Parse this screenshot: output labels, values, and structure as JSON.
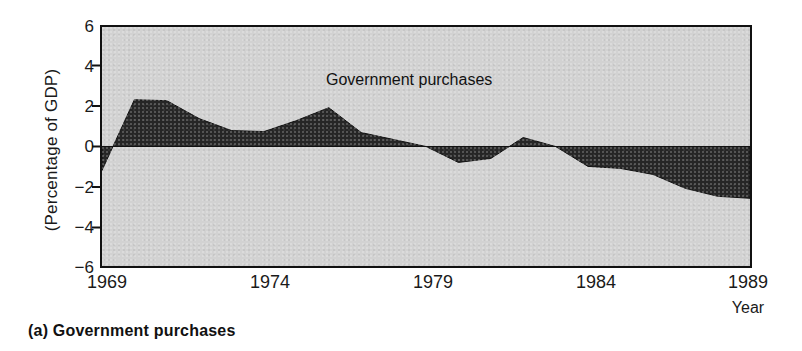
{
  "caption": "(a) Government purchases",
  "axis": {
    "ylabel": "(Percentage of GDP)",
    "xlabel": "Year",
    "yticks": [
      "6",
      "4",
      "2",
      "0",
      "−2",
      "−4",
      "−6"
    ],
    "xticks": [
      "1969",
      "1974",
      "1979",
      "1984",
      "1989"
    ]
  },
  "colors": {
    "plot_background": "#d2d2d2",
    "area_fill": "#262626",
    "frame": "#111111",
    "text": "#1a1a1a"
  },
  "chart_data": {
    "type": "area",
    "title": "Government purchases",
    "series_label": "Government purchases",
    "xlabel": "Year",
    "ylabel": "(Percentage of GDP)",
    "xlim": [
      1969,
      1989
    ],
    "ylim": [
      -6,
      6
    ],
    "ytick_values": [
      6,
      4,
      2,
      0,
      -2,
      -4,
      -6
    ],
    "xtick_values": [
      1969,
      1974,
      1979,
      1984,
      1989
    ],
    "grid": false,
    "legend": "none",
    "baseline": 0,
    "x": [
      1969,
      1970,
      1971,
      1972,
      1973,
      1974,
      1975,
      1976,
      1977,
      1978,
      1979,
      1980,
      1981,
      1982,
      1983,
      1984,
      1985,
      1986,
      1987,
      1988,
      1989
    ],
    "values": [
      -1.2,
      2.35,
      2.3,
      1.4,
      0.8,
      0.75,
      1.3,
      1.95,
      0.7,
      0.35,
      0.0,
      -0.8,
      -0.6,
      0.45,
      0.0,
      -1.0,
      -1.1,
      -1.4,
      -2.1,
      -2.5,
      -2.6
    ]
  }
}
